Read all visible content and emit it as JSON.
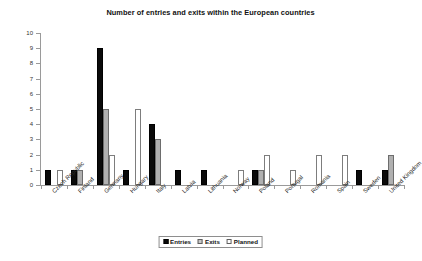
{
  "chart_data": {
    "type": "bar",
    "title": "Number of entries and exits within the European countries",
    "xlabel": "",
    "ylabel": "",
    "ylim": [
      0,
      10
    ],
    "yticks": [
      0,
      1,
      2,
      3,
      4,
      5,
      6,
      7,
      8,
      9,
      10
    ],
    "grid": false,
    "legend_position": "bottom-center",
    "categories": [
      "Czech Republic",
      "Finland",
      "Germany",
      "Hungary",
      "Italy",
      "Latvia",
      "Lithuania",
      "Norway",
      "Poland",
      "Portugal",
      "Romania",
      "Spain",
      "Sweden",
      "United Kingdom"
    ],
    "series": [
      {
        "name": "Entries",
        "color": "#0a0a0a",
        "values": [
          1,
          1,
          9,
          1,
          4,
          1,
          1,
          0,
          1,
          0,
          0,
          0,
          1,
          1
        ]
      },
      {
        "name": "Exits",
        "color": "#b0b0b0",
        "values": [
          0,
          1,
          5,
          0,
          3,
          0,
          0,
          0,
          1,
          0,
          0,
          0,
          0,
          2
        ]
      },
      {
        "name": "Planned",
        "color": "#ffffff",
        "values": [
          1,
          0,
          2,
          5,
          0,
          0,
          0,
          1,
          2,
          1,
          2,
          2,
          0,
          0
        ]
      }
    ]
  },
  "legend": {
    "items": [
      {
        "label": "Entries",
        "swatch": "entries"
      },
      {
        "label": "Exits",
        "swatch": "exits"
      },
      {
        "label": "Planned",
        "swatch": "planned"
      }
    ]
  }
}
